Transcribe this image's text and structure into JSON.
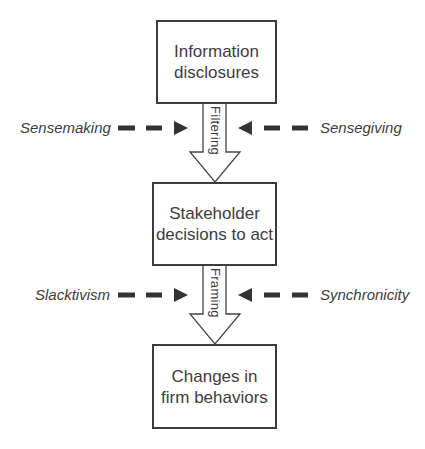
{
  "diagram": {
    "boxes": [
      {
        "id": "information-disclosures",
        "label": "Information\ndisclosures"
      },
      {
        "id": "stakeholder-decisions",
        "label": "Stakeholder\ndecisions to act"
      },
      {
        "id": "changes-firm-behaviors",
        "label": "Changes in\nfirm behaviors"
      }
    ],
    "flow_arrows": [
      {
        "from": "information-disclosures",
        "to": "stakeholder-decisions",
        "label": "Filtering"
      },
      {
        "from": "stakeholder-decisions",
        "to": "changes-firm-behaviors",
        "label": "Framing"
      }
    ],
    "influences": [
      {
        "label": "Sensemaking",
        "side": "left",
        "targets": "Filtering",
        "style": "dashed"
      },
      {
        "label": "Sensegiving",
        "side": "right",
        "targets": "Filtering",
        "style": "dashed"
      },
      {
        "label": "Slacktivism",
        "side": "left",
        "targets": "Framing",
        "style": "dashed"
      },
      {
        "label": "Synchronicity",
        "side": "right",
        "targets": "Framing",
        "style": "dashed"
      }
    ],
    "colors": {
      "stroke": "#3c3c3c",
      "text": "#3d3d3d",
      "background": "#ffffff"
    }
  }
}
